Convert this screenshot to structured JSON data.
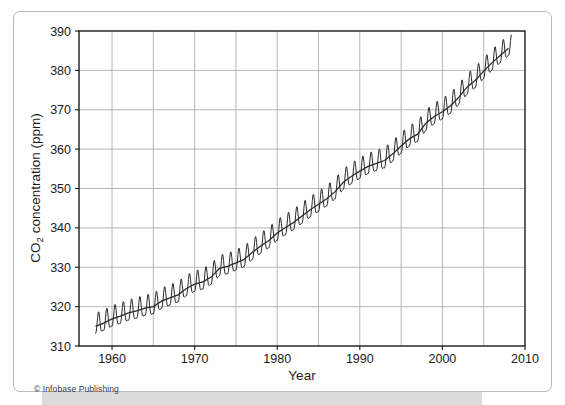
{
  "figure": {
    "credit": "© Infobase Publishing",
    "background_color": "#ffffff",
    "card_border_color": "#b9b9b9",
    "band_color": "#dcdcdc"
  },
  "chart_data": {
    "type": "line",
    "title": "",
    "subtitle": "",
    "xlabel": "Year",
    "ylabel": "CO2 concentration (ppm)",
    "ylabel_parts": {
      "pre": "CO",
      "sub": "2",
      "post": " concentration (ppm)"
    },
    "xlim": [
      1956,
      2010
    ],
    "ylim": [
      310,
      390
    ],
    "xticks": [
      1960,
      1970,
      1980,
      1990,
      2000,
      2010
    ],
    "xtick_labels": [
      "1960",
      "1970",
      "1980",
      "1990",
      "2000",
      "2010"
    ],
    "yticks": [
      310,
      320,
      330,
      340,
      350,
      360,
      370,
      380,
      390
    ],
    "ytick_labels": [
      "310",
      "320",
      "330",
      "340",
      "350",
      "360",
      "370",
      "380",
      "390"
    ],
    "x_gridlines": [
      1960,
      1965,
      1970,
      1975,
      1980,
      1985,
      1990,
      1995,
      2000,
      2005,
      2010
    ],
    "y_gridlines": [
      320,
      330,
      340,
      350,
      360,
      370,
      380
    ],
    "grid": true,
    "grid_color": "#b0b0b0",
    "axis_color": "#1a1a1a",
    "line_color": "#2b2b2b",
    "legend": null,
    "seasonal_amplitude_ppm": 6.0,
    "series": [
      {
        "name": "Monthly mean CO2 (Mauna Loa, seasonal cycle)",
        "style": "sawtooth-oscillation",
        "color": "#2b2b2b"
      },
      {
        "name": "Annual mean trend",
        "style": "smooth-trend",
        "color": "#2b2b2b"
      }
    ],
    "x": [
      1958.0,
      1959.0,
      1960.0,
      1961.0,
      1962.0,
      1963.0,
      1964.0,
      1965.0,
      1966.0,
      1967.0,
      1968.0,
      1969.0,
      1970.0,
      1971.0,
      1972.0,
      1973.0,
      1974.0,
      1975.0,
      1976.0,
      1977.0,
      1978.0,
      1979.0,
      1980.0,
      1981.0,
      1982.0,
      1983.0,
      1984.0,
      1985.0,
      1986.0,
      1987.0,
      1988.0,
      1989.0,
      1990.0,
      1991.0,
      1992.0,
      1993.0,
      1994.0,
      1995.0,
      1996.0,
      1997.0,
      1998.0,
      1999.0,
      2000.0,
      2001.0,
      2002.0,
      2003.0,
      2004.0,
      2005.0,
      2006.0,
      2007.0,
      2008.0
    ],
    "values": [
      315.0,
      315.8,
      316.9,
      317.6,
      318.4,
      318.9,
      319.6,
      320.0,
      321.4,
      322.2,
      323.0,
      324.6,
      325.7,
      326.3,
      327.5,
      329.7,
      330.2,
      331.1,
      332.0,
      333.8,
      335.4,
      336.8,
      338.7,
      340.1,
      341.4,
      343.0,
      344.6,
      346.0,
      347.4,
      349.2,
      351.6,
      353.1,
      354.4,
      355.6,
      356.4,
      357.1,
      358.8,
      360.8,
      362.6,
      363.8,
      366.6,
      368.3,
      369.5,
      371.0,
      373.2,
      375.8,
      377.5,
      379.8,
      381.9,
      383.8,
      385.6
    ]
  }
}
